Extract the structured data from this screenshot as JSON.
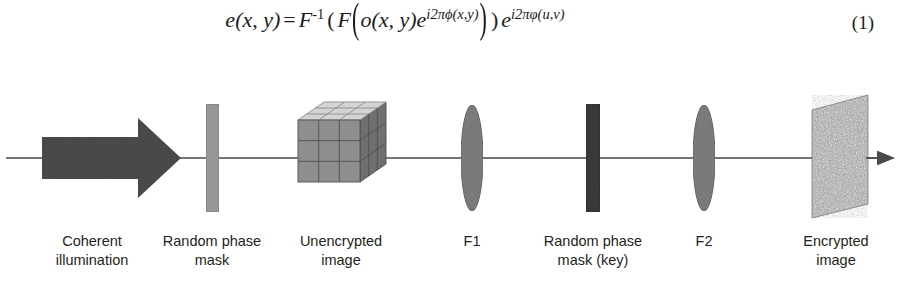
{
  "equation": {
    "lhs_e": "e",
    "lhs_args": "(x, y)",
    "equals": "=",
    "fourier_inv": "F",
    "fourier_inv_sup": "-1",
    "fourier": "F",
    "object_o": "o",
    "object_args": "(x, y)",
    "exp_base": "e",
    "phase_mask_exp": "i2πϕ(x,y)",
    "key_exp": "i2πφ(u,v)",
    "number": "(1)",
    "plain_text": "e(x, y) = F^-1( F( o(x, y) e^{i2πϕ(x,y)} ) ) e^{i2πφ(u,v)}"
  },
  "diagram": {
    "axis": {
      "name": "optical-axis",
      "y": 106,
      "x_start": 6,
      "x_end": 900,
      "color": "#4a4a4a"
    },
    "elements": [
      {
        "id": "coherent-illumination",
        "kind": "block-arrow",
        "label_line1": "Coherent",
        "label_line2": "illumination",
        "label_center_x": 92,
        "color": "#4a4a4a",
        "x": 42,
        "width": 138
      },
      {
        "id": "random-phase-mask",
        "kind": "vertical-bar",
        "label_line1": "Random phase",
        "label_line2": "mask",
        "label_center_x": 212,
        "color": "#9a9a9a",
        "x": 206,
        "width": 13
      },
      {
        "id": "unencrypted-image",
        "kind": "cube",
        "label_line1": "Unencrypted",
        "label_line2": "image",
        "label_center_x": 341,
        "color_top": "#d4d4d4",
        "color_front": "#8e8e8e",
        "color_side": "#6f6f6f",
        "x": 298,
        "width": 88
      },
      {
        "id": "lens-f1",
        "kind": "lens",
        "label_line1": "F1",
        "label_line2": "",
        "label_center_x": 472,
        "color": "#7d7d7d",
        "x": 472,
        "width": 22
      },
      {
        "id": "random-phase-mask-key",
        "kind": "vertical-bar",
        "label_line1": "Random phase",
        "label_line2": "mask (key)",
        "label_center_x": 593,
        "color": "#3a3a3a",
        "x": 586,
        "width": 14
      },
      {
        "id": "lens-f2",
        "kind": "lens",
        "label_line1": "F2",
        "label_line2": "",
        "label_center_x": 704,
        "color": "#7d7d7d",
        "x": 704,
        "width": 22
      },
      {
        "id": "encrypted-image",
        "kind": "noise-plane",
        "label_line1": "Encrypted",
        "label_line2": "image",
        "label_center_x": 836,
        "color": "#8a8a8a",
        "x": 812,
        "width": 56
      }
    ]
  }
}
